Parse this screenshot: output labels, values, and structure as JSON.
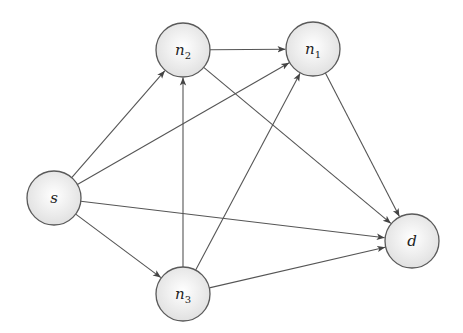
{
  "diagram": {
    "type": "directed-graph",
    "colors": {
      "node_fill_center": "#ffffff",
      "node_fill_edge": "#e2e2e2",
      "node_stroke": "#5a5a5a",
      "edge": "#555555"
    },
    "node_radius": 27,
    "nodes": [
      {
        "id": "s",
        "label": "s",
        "sub": "",
        "x": 54,
        "y": 198
      },
      {
        "id": "n2",
        "label": "n",
        "sub": "2",
        "x": 183,
        "y": 50
      },
      {
        "id": "n1",
        "label": "n",
        "sub": "1",
        "x": 313,
        "y": 49
      },
      {
        "id": "n3",
        "label": "n",
        "sub": "3",
        "x": 183,
        "y": 294
      },
      {
        "id": "d",
        "label": "d",
        "sub": "",
        "x": 412,
        "y": 241
      }
    ],
    "edges": [
      {
        "from": "s",
        "to": "n2"
      },
      {
        "from": "s",
        "to": "n1"
      },
      {
        "from": "s",
        "to": "d"
      },
      {
        "from": "s",
        "to": "n3"
      },
      {
        "from": "n2",
        "to": "n1"
      },
      {
        "from": "n2",
        "to": "d"
      },
      {
        "from": "n3",
        "to": "n2"
      },
      {
        "from": "n3",
        "to": "n1"
      },
      {
        "from": "n3",
        "to": "d"
      },
      {
        "from": "n1",
        "to": "d"
      }
    ]
  }
}
